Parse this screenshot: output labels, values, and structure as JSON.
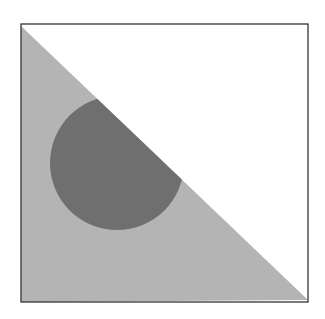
{
  "figure": {
    "colors": {
      "background": "#ffffff",
      "border": "#333333",
      "triangle_fill": "#b4b4b4",
      "circle_fill": "#6f6f6f"
    },
    "square": {
      "x": 21,
      "y": 24,
      "width": 287,
      "height": 278
    },
    "triangle": {
      "points": "21,26 308,300 21,302"
    },
    "circle": {
      "cx": 117,
      "cy": 163,
      "r": 67
    }
  }
}
